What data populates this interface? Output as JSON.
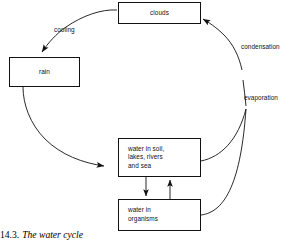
{
  "figure": {
    "caption_number": "14.3.",
    "caption_title": "The water cycle"
  },
  "nodes": {
    "clouds": {
      "label": "clouds"
    },
    "rain": {
      "label": "rain"
    },
    "water_in_soil": {
      "label": "water in soil,\nlakes, rivers\nand sea"
    },
    "water_in_organisms": {
      "label": "water in\norganisms"
    }
  },
  "edge_labels": {
    "cooling": "cooling",
    "condensation": "condensation",
    "evaporation": "evaporation"
  },
  "colors": {
    "stroke": "#111111",
    "background": "#ffffff",
    "text": "#111111"
  }
}
